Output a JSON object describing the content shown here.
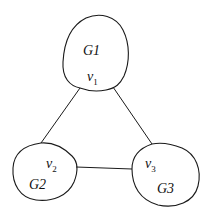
{
  "diagram": {
    "type": "graph",
    "components": [
      {
        "id": "G1",
        "label": "G1",
        "vertex": "v",
        "vertex_sub": "1"
      },
      {
        "id": "G2",
        "label": "G2",
        "vertex": "v",
        "vertex_sub": "2"
      },
      {
        "id": "G3",
        "label": "G3",
        "vertex": "v",
        "vertex_sub": "3"
      }
    ],
    "edges": [
      {
        "from": "v1",
        "to": "v2"
      },
      {
        "from": "v1",
        "to": "v3"
      },
      {
        "from": "v2",
        "to": "v3"
      }
    ],
    "colors": {
      "stroke": "#1a1a1a",
      "background": "#ffffff"
    }
  }
}
